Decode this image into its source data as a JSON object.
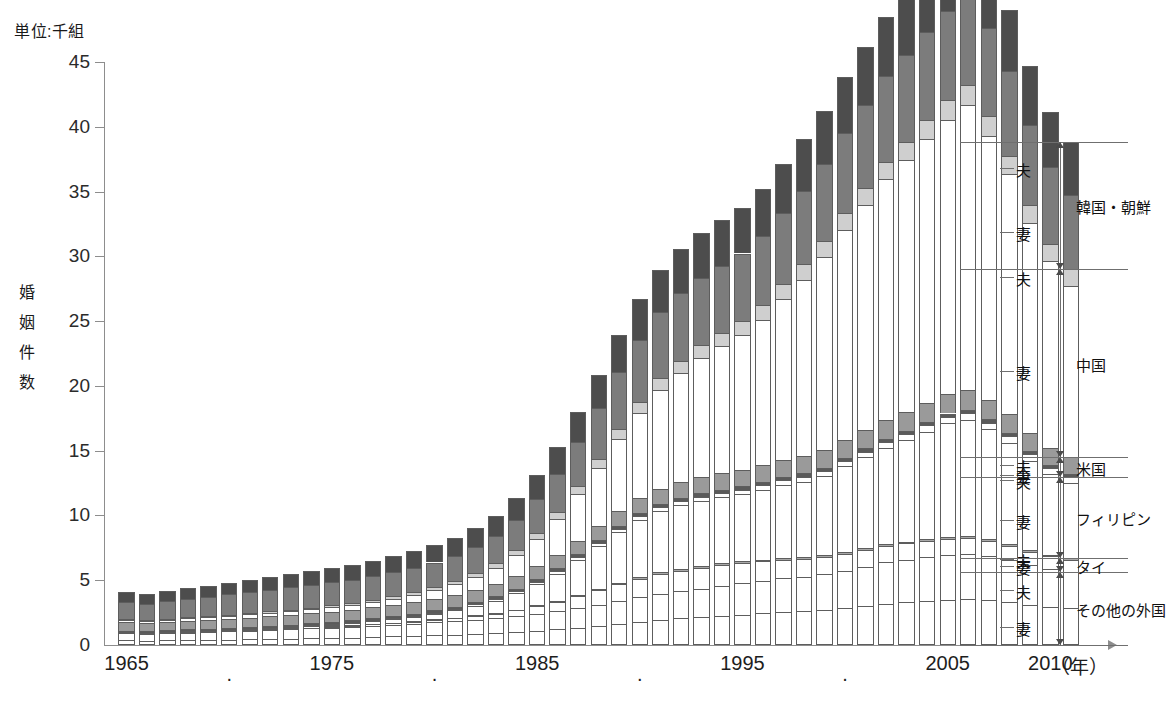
{
  "unit_label": "単位:千組",
  "y_axis_title": "婚姻件数",
  "x_axis_unit": "（年）",
  "colors": {
    "korea_husband": "#4d4d4d",
    "korea_wife": "#7c7c7c",
    "china_husband": "#cfcfcf",
    "china_wife": "#ffffff",
    "usa_husband": "#9a9a9a",
    "usa_wife": "#5a5a5a",
    "philippines_husband": "#ffffff",
    "philippines_wife": "#ffffff",
    "thailand_husband": "#a8a8a8",
    "thailand_wife": "#ffffff",
    "other_husband": "#ffffff",
    "other_wife": "#ffffff",
    "outline": "#5d5d5d",
    "axis": "#8d8d8d"
  },
  "legend": {
    "sub_labels": {
      "husband": "夫",
      "wife": "妻"
    },
    "groups": [
      {
        "name": "韓国・朝鮮",
        "husband": "夫",
        "wife": "妻"
      },
      {
        "name": "中国",
        "husband": "夫",
        "wife": "妻"
      },
      {
        "name": "米国",
        "husband": "夫",
        "wife": "妻"
      },
      {
        "name": "フィリピン",
        "husband": "夫",
        "wife": "妻"
      },
      {
        "name": "タイ",
        "husband": "夫",
        "wife": "妻"
      },
      {
        "name": "その他の外国",
        "husband": "夫",
        "wife": "妻"
      }
    ]
  },
  "chart_data": {
    "type": "bar",
    "title": "",
    "subtitle": "",
    "xlabel": "（年）",
    "ylabel": "婚姻件数",
    "unit": "単位:千組",
    "stacked": true,
    "grid": false,
    "legend_position": "right",
    "ylim": [
      0,
      45
    ],
    "yticks": [
      0,
      5,
      10,
      15,
      20,
      25,
      30,
      35,
      40,
      45
    ],
    "xtick_labels": [
      "1965",
      "・",
      "1975",
      "・",
      "1985",
      "・",
      "1995",
      "・",
      "2005",
      "2010"
    ],
    "xtick_years": [
      1965,
      1970,
      1975,
      1980,
      1985,
      1990,
      1995,
      2000,
      2005,
      2010
    ],
    "categories": [
      1965,
      1966,
      1967,
      1968,
      1969,
      1970,
      1971,
      1972,
      1973,
      1974,
      1975,
      1976,
      1977,
      1978,
      1979,
      1980,
      1981,
      1982,
      1983,
      1984,
      1985,
      1986,
      1987,
      1988,
      1989,
      1990,
      1991,
      1992,
      1993,
      1994,
      1995,
      1996,
      1997,
      1998,
      1999,
      2000,
      2001,
      2002,
      2003,
      2004,
      2005,
      2006,
      2007,
      2008,
      2009,
      2010,
      2011
    ],
    "series": [
      {
        "name": "その他の外国 妻",
        "key": "other_wife",
        "values": [
          0.35,
          0.33,
          0.36,
          0.38,
          0.4,
          0.42,
          0.45,
          0.47,
          0.5,
          0.52,
          0.55,
          0.58,
          0.62,
          0.66,
          0.7,
          0.75,
          0.8,
          0.86,
          0.92,
          1.0,
          1.1,
          1.2,
          1.35,
          1.5,
          1.65,
          1.8,
          1.95,
          2.05,
          2.15,
          2.25,
          2.35,
          2.45,
          2.55,
          2.6,
          2.7,
          2.85,
          3.0,
          3.2,
          3.3,
          3.4,
          3.5,
          3.55,
          3.45,
          3.3,
          3.1,
          2.95,
          2.85
        ]
      },
      {
        "name": "その他の外国 夫",
        "key": "other_husband",
        "values": [
          0.55,
          0.52,
          0.55,
          0.58,
          0.6,
          0.63,
          0.66,
          0.7,
          0.73,
          0.76,
          0.8,
          0.84,
          0.88,
          0.92,
          0.96,
          1.0,
          1.05,
          1.1,
          1.15,
          1.22,
          1.3,
          1.4,
          1.5,
          1.62,
          1.75,
          1.88,
          2.0,
          2.1,
          2.2,
          2.3,
          2.4,
          2.5,
          2.6,
          2.65,
          2.75,
          2.9,
          3.05,
          3.2,
          3.3,
          3.4,
          3.45,
          3.5,
          3.4,
          3.25,
          3.05,
          2.9,
          2.8
        ]
      },
      {
        "name": "タイ 妻",
        "key": "thailand_wife",
        "values": [
          0.02,
          0.02,
          0.02,
          0.02,
          0.03,
          0.03,
          0.03,
          0.04,
          0.04,
          0.05,
          0.06,
          0.07,
          0.09,
          0.11,
          0.14,
          0.18,
          0.22,
          0.28,
          0.35,
          0.45,
          0.58,
          0.72,
          0.9,
          1.1,
          1.3,
          1.45,
          1.55,
          1.6,
          1.62,
          1.6,
          1.55,
          1.5,
          1.45,
          1.4,
          1.35,
          1.3,
          1.28,
          1.26,
          1.24,
          1.22,
          1.2,
          1.18,
          1.15,
          1.12,
          1.05,
          1.0,
          0.95
        ]
      },
      {
        "name": "タイ 夫",
        "key": "thailand_husband",
        "values": [
          0.01,
          0.01,
          0.01,
          0.01,
          0.01,
          0.01,
          0.01,
          0.01,
          0.02,
          0.02,
          0.02,
          0.02,
          0.03,
          0.03,
          0.04,
          0.04,
          0.05,
          0.05,
          0.06,
          0.07,
          0.08,
          0.09,
          0.1,
          0.11,
          0.12,
          0.13,
          0.14,
          0.15,
          0.15,
          0.15,
          0.15,
          0.15,
          0.15,
          0.15,
          0.15,
          0.15,
          0.15,
          0.15,
          0.15,
          0.15,
          0.15,
          0.15,
          0.15,
          0.14,
          0.13,
          0.12,
          0.12
        ]
      },
      {
        "name": "フィリピン 妻",
        "key": "philippines_wife",
        "values": [
          0.05,
          0.05,
          0.05,
          0.06,
          0.06,
          0.07,
          0.08,
          0.09,
          0.1,
          0.12,
          0.14,
          0.17,
          0.21,
          0.26,
          0.33,
          0.42,
          0.55,
          0.72,
          0.95,
          1.25,
          1.65,
          2.1,
          2.7,
          3.3,
          3.9,
          4.4,
          4.7,
          4.9,
          5.0,
          5.1,
          5.2,
          5.4,
          5.6,
          5.8,
          6.1,
          6.6,
          7.0,
          7.4,
          7.8,
          8.3,
          8.8,
          9.0,
          8.5,
          7.8,
          6.9,
          6.2,
          5.8
        ]
      },
      {
        "name": "フィリピン 夫",
        "key": "philippines_husband",
        "values": [
          0.02,
          0.02,
          0.02,
          0.02,
          0.02,
          0.03,
          0.03,
          0.03,
          0.04,
          0.04,
          0.05,
          0.05,
          0.06,
          0.07,
          0.08,
          0.09,
          0.1,
          0.12,
          0.14,
          0.16,
          0.18,
          0.2,
          0.22,
          0.24,
          0.26,
          0.28,
          0.3,
          0.32,
          0.33,
          0.34,
          0.35,
          0.36,
          0.37,
          0.38,
          0.39,
          0.4,
          0.42,
          0.44,
          0.46,
          0.48,
          0.5,
          0.52,
          0.52,
          0.5,
          0.48,
          0.46,
          0.45
        ]
      },
      {
        "name": "米国 妻",
        "key": "usa_wife",
        "values": [
          0.12,
          0.12,
          0.12,
          0.13,
          0.13,
          0.14,
          0.14,
          0.15,
          0.15,
          0.16,
          0.16,
          0.17,
          0.17,
          0.18,
          0.18,
          0.19,
          0.19,
          0.2,
          0.2,
          0.21,
          0.21,
          0.22,
          0.22,
          0.23,
          0.23,
          0.24,
          0.24,
          0.25,
          0.25,
          0.25,
          0.26,
          0.26,
          0.26,
          0.26,
          0.26,
          0.27,
          0.27,
          0.27,
          0.27,
          0.27,
          0.27,
          0.27,
          0.26,
          0.26,
          0.25,
          0.25,
          0.24
        ]
      },
      {
        "name": "米国 夫",
        "key": "usa_husband",
        "values": [
          0.65,
          0.62,
          0.64,
          0.66,
          0.68,
          0.7,
          0.72,
          0.74,
          0.76,
          0.78,
          0.8,
          0.82,
          0.84,
          0.86,
          0.88,
          0.9,
          0.92,
          0.94,
          0.96,
          0.98,
          1.0,
          1.02,
          1.05,
          1.08,
          1.12,
          1.16,
          1.2,
          1.22,
          1.24,
          1.26,
          1.28,
          1.3,
          1.32,
          1.34,
          1.36,
          1.38,
          1.4,
          1.42,
          1.44,
          1.46,
          1.48,
          1.5,
          1.48,
          1.45,
          1.4,
          1.36,
          1.32
        ]
      },
      {
        "name": "中国 妻",
        "key": "china_wife",
        "values": [
          0.18,
          0.18,
          0.19,
          0.2,
          0.21,
          0.22,
          0.24,
          0.26,
          0.28,
          0.31,
          0.34,
          0.38,
          0.43,
          0.5,
          0.58,
          0.68,
          0.82,
          1.0,
          1.25,
          1.6,
          2.1,
          2.8,
          3.6,
          4.5,
          5.6,
          6.6,
          7.6,
          8.4,
          9.2,
          9.8,
          10.4,
          11.2,
          12.4,
          13.6,
          14.9,
          16.2,
          17.4,
          18.6,
          19.5,
          20.4,
          21.2,
          22.0,
          20.4,
          18.5,
          16.2,
          14.4,
          13.2
        ]
      },
      {
        "name": "中国 夫",
        "key": "china_husband",
        "values": [
          0.08,
          0.08,
          0.08,
          0.09,
          0.09,
          0.1,
          0.1,
          0.11,
          0.12,
          0.13,
          0.14,
          0.15,
          0.17,
          0.19,
          0.21,
          0.24,
          0.27,
          0.31,
          0.35,
          0.4,
          0.46,
          0.52,
          0.6,
          0.68,
          0.76,
          0.84,
          0.9,
          0.95,
          1.0,
          1.04,
          1.08,
          1.12,
          1.16,
          1.2,
          1.24,
          1.28,
          1.32,
          1.36,
          1.4,
          1.44,
          1.48,
          1.52,
          1.5,
          1.46,
          1.4,
          1.34,
          1.28
        ]
      },
      {
        "name": "韓国・朝鮮 妻",
        "key": "korea_wife",
        "values": [
          1.3,
          1.25,
          1.32,
          1.4,
          1.48,
          1.55,
          1.62,
          1.68,
          1.72,
          1.75,
          1.78,
          1.8,
          1.82,
          1.84,
          1.86,
          1.88,
          1.92,
          1.98,
          2.1,
          2.3,
          2.6,
          2.95,
          3.4,
          3.9,
          4.4,
          4.8,
          5.1,
          5.2,
          5.2,
          5.2,
          5.2,
          5.3,
          5.5,
          5.7,
          5.9,
          6.2,
          6.4,
          6.6,
          6.7,
          6.8,
          6.9,
          7.0,
          6.8,
          6.5,
          6.2,
          5.9,
          5.7
        ]
      },
      {
        "name": "韓国・朝鮮 夫",
        "key": "korea_husband",
        "values": [
          0.75,
          0.72,
          0.78,
          0.82,
          0.88,
          0.92,
          0.96,
          1.0,
          1.04,
          1.08,
          1.12,
          1.16,
          1.2,
          1.24,
          1.28,
          1.32,
          1.38,
          1.45,
          1.55,
          1.7,
          1.9,
          2.1,
          2.35,
          2.6,
          2.85,
          3.1,
          3.3,
          3.4,
          3.45,
          3.5,
          3.55,
          3.65,
          3.8,
          3.95,
          4.1,
          4.3,
          4.45,
          4.6,
          4.7,
          4.8,
          4.9,
          5.0,
          4.9,
          4.7,
          4.5,
          4.3,
          4.15
        ]
      }
    ],
    "totals": [
      4.08,
      3.92,
      4.14,
      4.36,
      4.59,
      4.82,
      5.04,
      5.28,
      5.5,
      5.72,
      5.96,
      6.21,
      6.52,
      6.86,
      7.24,
      7.69,
      8.29,
      9.01,
      10.08,
      11.34,
      13.16,
      15.32,
      18.01,
      20.86,
      23.94,
      26.68,
      28.98,
      30.54,
      31.81,
      32.79,
      33.77,
      35.19,
      36.96,
      38.73,
      41.0,
      43.45,
      45.74,
      48.0,
      49.76,
      51.52,
      52.93,
      54.19,
      51.51,
      48.38,
      44.56,
      41.18,
      38.96
    ]
  }
}
